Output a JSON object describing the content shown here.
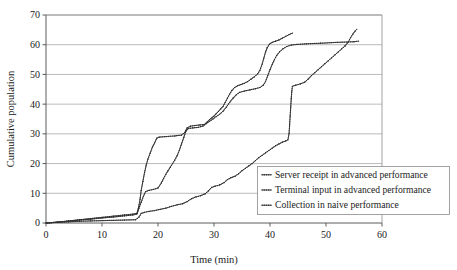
{
  "chart_data": {
    "type": "line",
    "title": "",
    "xlabel": "Time (min)",
    "ylabel": "Cumulative population",
    "xlim": [
      0,
      60
    ],
    "ylim": [
      0,
      70
    ],
    "xticks": [
      0,
      10,
      20,
      30,
      40,
      50,
      60
    ],
    "yticks": [
      0,
      10,
      20,
      30,
      40,
      50,
      60,
      70
    ],
    "grid": "horizontal",
    "legend_position": "lower-right-inside",
    "series": [
      {
        "name": "Server receipt in advanced performance",
        "marker": "dotted-step",
        "color": "#3a3a3a",
        "points": [
          [
            0.0,
            0.0
          ],
          [
            2.0,
            0.3
          ],
          [
            4.0,
            0.6
          ],
          [
            6.0,
            1.0
          ],
          [
            8.0,
            1.3
          ],
          [
            10.0,
            1.7
          ],
          [
            12.0,
            2.0
          ],
          [
            14.0,
            2.4
          ],
          [
            15.5,
            2.7
          ],
          [
            16.2,
            3.0
          ],
          [
            16.5,
            5.0
          ],
          [
            16.8,
            8.0
          ],
          [
            17.0,
            11.0
          ],
          [
            17.3,
            14.0
          ],
          [
            17.6,
            17.0
          ],
          [
            17.9,
            19.5
          ],
          [
            18.2,
            21.5
          ],
          [
            18.6,
            23.5
          ],
          [
            19.0,
            25.5
          ],
          [
            19.4,
            27.0
          ],
          [
            19.8,
            28.6
          ],
          [
            20.2,
            28.9
          ],
          [
            21.5,
            29.1
          ],
          [
            23.0,
            29.3
          ],
          [
            24.2,
            29.6
          ],
          [
            24.8,
            30.5
          ],
          [
            25.2,
            32.0
          ],
          [
            25.8,
            32.6
          ],
          [
            26.5,
            32.8
          ],
          [
            27.5,
            33.0
          ],
          [
            28.3,
            33.2
          ],
          [
            28.8,
            34.0
          ],
          [
            29.2,
            34.8
          ],
          [
            29.6,
            35.4
          ],
          [
            30.0,
            36.0
          ],
          [
            30.4,
            36.8
          ],
          [
            30.8,
            37.6
          ],
          [
            31.2,
            38.4
          ],
          [
            31.6,
            39.2
          ],
          [
            32.0,
            40.6
          ],
          [
            32.4,
            42.0
          ],
          [
            32.8,
            43.4
          ],
          [
            33.2,
            44.6
          ],
          [
            33.7,
            45.6
          ],
          [
            34.2,
            46.2
          ],
          [
            34.8,
            46.6
          ],
          [
            35.4,
            47.0
          ],
          [
            36.0,
            47.6
          ],
          [
            36.6,
            48.4
          ],
          [
            37.2,
            49.2
          ],
          [
            37.8,
            50.2
          ],
          [
            38.2,
            51.4
          ],
          [
            38.6,
            53.5
          ],
          [
            38.9,
            55.5
          ],
          [
            39.2,
            57.5
          ],
          [
            39.5,
            59.0
          ],
          [
            39.9,
            60.2
          ],
          [
            40.4,
            60.8
          ],
          [
            41.0,
            61.2
          ],
          [
            41.6,
            61.6
          ],
          [
            42.2,
            62.2
          ],
          [
            42.8,
            62.8
          ],
          [
            43.4,
            63.4
          ],
          [
            44.0,
            63.9
          ]
        ]
      },
      {
        "name": "Terminal input in advanced performance",
        "marker": "dotted-step",
        "color": "#4a4a4a",
        "points": [
          [
            0.0,
            0.0
          ],
          [
            2.0,
            0.3
          ],
          [
            4.0,
            0.7
          ],
          [
            6.0,
            1.1
          ],
          [
            8.0,
            1.5
          ],
          [
            10.0,
            1.9
          ],
          [
            12.0,
            2.3
          ],
          [
            14.0,
            2.7
          ],
          [
            15.5,
            3.0
          ],
          [
            16.3,
            3.3
          ],
          [
            16.6,
            5.0
          ],
          [
            17.0,
            7.0
          ],
          [
            17.4,
            9.0
          ],
          [
            17.8,
            10.6
          ],
          [
            18.4,
            11.0
          ],
          [
            19.2,
            11.3
          ],
          [
            20.0,
            11.8
          ],
          [
            20.6,
            13.5
          ],
          [
            21.0,
            15.0
          ],
          [
            21.4,
            16.4
          ],
          [
            21.8,
            17.6
          ],
          [
            22.2,
            18.8
          ],
          [
            22.6,
            20.0
          ],
          [
            23.0,
            21.2
          ],
          [
            23.4,
            22.6
          ],
          [
            23.8,
            24.4
          ],
          [
            24.2,
            26.6
          ],
          [
            24.6,
            28.8
          ],
          [
            25.0,
            31.0
          ],
          [
            25.4,
            31.8
          ],
          [
            26.2,
            32.0
          ],
          [
            27.2,
            32.2
          ],
          [
            28.0,
            32.6
          ],
          [
            28.6,
            33.4
          ],
          [
            29.2,
            34.2
          ],
          [
            29.8,
            35.0
          ],
          [
            30.4,
            35.8
          ],
          [
            31.0,
            36.6
          ],
          [
            31.6,
            37.6
          ],
          [
            32.2,
            39.0
          ],
          [
            32.8,
            40.6
          ],
          [
            33.4,
            42.0
          ],
          [
            34.0,
            43.2
          ],
          [
            34.6,
            44.0
          ],
          [
            35.4,
            44.4
          ],
          [
            36.4,
            44.8
          ],
          [
            37.4,
            45.2
          ],
          [
            38.2,
            45.6
          ],
          [
            38.8,
            46.4
          ],
          [
            39.2,
            47.6
          ],
          [
            39.6,
            49.6
          ],
          [
            40.0,
            51.6
          ],
          [
            40.4,
            53.4
          ],
          [
            40.8,
            55.0
          ],
          [
            41.2,
            56.4
          ],
          [
            41.7,
            57.6
          ],
          [
            42.3,
            58.6
          ],
          [
            43.0,
            59.4
          ],
          [
            43.8,
            59.9
          ],
          [
            44.8,
            60.1
          ],
          [
            46.5,
            60.3
          ],
          [
            49.0,
            60.5
          ],
          [
            52.0,
            60.8
          ],
          [
            55.0,
            61.0
          ],
          [
            55.8,
            61.2
          ]
        ]
      },
      {
        "name": "Collection in naive performance",
        "marker": "dotted-step",
        "color": "#2b2b2b",
        "points": [
          [
            0.0,
            0.0
          ],
          [
            2.0,
            0.2
          ],
          [
            4.0,
            0.4
          ],
          [
            6.0,
            0.6
          ],
          [
            8.0,
            0.7
          ],
          [
            10.0,
            0.8
          ],
          [
            12.0,
            0.9
          ],
          [
            14.0,
            1.0
          ],
          [
            16.0,
            1.1
          ],
          [
            16.6,
            2.0
          ],
          [
            17.0,
            3.2
          ],
          [
            17.6,
            3.6
          ],
          [
            18.4,
            3.9
          ],
          [
            19.4,
            4.2
          ],
          [
            20.4,
            4.6
          ],
          [
            21.4,
            5.0
          ],
          [
            22.4,
            5.6
          ],
          [
            23.4,
            6.1
          ],
          [
            24.4,
            6.5
          ],
          [
            25.2,
            7.2
          ],
          [
            26.0,
            8.2
          ],
          [
            26.8,
            8.8
          ],
          [
            27.6,
            9.2
          ],
          [
            28.4,
            9.8
          ],
          [
            29.0,
            10.8
          ],
          [
            29.6,
            12.0
          ],
          [
            30.2,
            12.4
          ],
          [
            31.0,
            12.8
          ],
          [
            31.8,
            13.6
          ],
          [
            32.4,
            14.6
          ],
          [
            33.0,
            15.2
          ],
          [
            33.8,
            15.8
          ],
          [
            34.4,
            16.6
          ],
          [
            35.0,
            17.6
          ],
          [
            35.6,
            18.4
          ],
          [
            36.2,
            19.2
          ],
          [
            36.8,
            20.0
          ],
          [
            37.4,
            21.0
          ],
          [
            38.0,
            22.0
          ],
          [
            38.6,
            22.8
          ],
          [
            39.2,
            23.6
          ],
          [
            39.8,
            24.4
          ],
          [
            40.4,
            25.2
          ],
          [
            41.0,
            26.0
          ],
          [
            41.6,
            26.6
          ],
          [
            42.2,
            27.2
          ],
          [
            42.8,
            27.6
          ],
          [
            43.2,
            28.0
          ],
          [
            43.4,
            30.0
          ],
          [
            43.5,
            33.0
          ],
          [
            43.6,
            36.0
          ],
          [
            43.7,
            39.0
          ],
          [
            43.8,
            42.0
          ],
          [
            43.9,
            44.5
          ],
          [
            44.0,
            46.0
          ],
          [
            44.6,
            46.4
          ],
          [
            45.4,
            46.8
          ],
          [
            46.2,
            47.4
          ],
          [
            46.8,
            48.4
          ],
          [
            47.4,
            49.6
          ],
          [
            48.0,
            50.6
          ],
          [
            48.6,
            51.6
          ],
          [
            49.2,
            52.6
          ],
          [
            49.8,
            53.6
          ],
          [
            50.4,
            54.6
          ],
          [
            51.0,
            55.6
          ],
          [
            51.6,
            56.6
          ],
          [
            52.2,
            57.6
          ],
          [
            52.8,
            58.6
          ],
          [
            53.4,
            59.6
          ],
          [
            54.0,
            61.0
          ],
          [
            54.4,
            62.4
          ],
          [
            54.8,
            63.6
          ],
          [
            55.2,
            64.6
          ],
          [
            55.5,
            65.2
          ]
        ]
      }
    ]
  },
  "axes": {
    "y_title": "Cumulative population",
    "x_title": "Time (min)",
    "x_tick_labels": [
      "0",
      "10",
      "20",
      "30",
      "40",
      "50",
      "60"
    ],
    "y_tick_labels": [
      "0",
      "10",
      "20",
      "30",
      "40",
      "50",
      "60",
      "70"
    ]
  },
  "legend": {
    "entries": [
      {
        "label": "Server receipt in advanced performance"
      },
      {
        "label": "Terminal input in advanced performance"
      },
      {
        "label": "Collection in naive performance"
      }
    ]
  }
}
